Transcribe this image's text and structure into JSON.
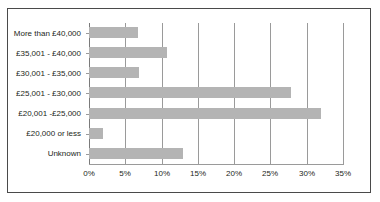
{
  "chart_data": {
    "type": "bar",
    "orientation": "horizontal",
    "title": "",
    "xlabel": "",
    "ylabel": "",
    "categories": [
      "More than £40,000",
      "£35,001 - £40,000",
      "£30,001 - £35,000",
      "£25,001 - £30,000",
      "£20,001 -£25,000",
      "£20,000 or less",
      "Unknown"
    ],
    "values": [
      6.8,
      10.8,
      6.9,
      27.9,
      32.0,
      1.9,
      13.0
    ],
    "value_unit": "%",
    "xlim": [
      0,
      35
    ],
    "xticks": [
      0,
      5,
      10,
      15,
      20,
      25,
      30,
      35
    ],
    "xtick_labels": [
      "0%",
      "5%",
      "10%",
      "15%",
      "20%",
      "25%",
      "30%",
      "35%"
    ],
    "grid": "vertical",
    "legend": "none",
    "bar_color": "#b4b4b4",
    "gridline_color": "#9a9a9a",
    "border_color": "#4a4a4a",
    "background_color": "#ffffff"
  }
}
